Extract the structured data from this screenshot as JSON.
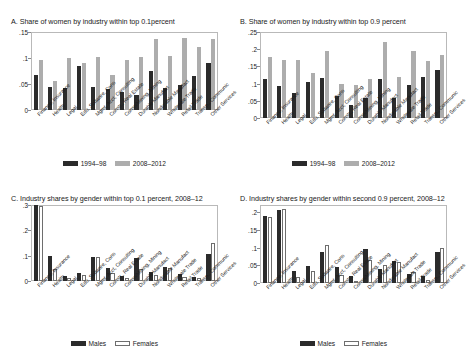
{
  "figure": {
    "background": "#ffffff",
    "colors": {
      "dark_bar": "#2b2b2b",
      "light_bar": "#adadad",
      "hollow_bar_fill": "#ffffff",
      "hollow_bar_edge": "#6e6e6e",
      "axis": "#8a8a8a",
      "text": "#1a1a1a"
    }
  },
  "industries": [
    "Finance, Insurance",
    "Health",
    "Legal",
    "Edu, Software, Cons",
    "Mgmt, Acct, Consulting",
    "Constr., Real Estate",
    "Conso/Mining, Mining",
    "Durable Manufact",
    "Nondurable Manufact",
    "Wholesale Trade",
    "Retail Trade",
    "Transp., Communic",
    "Other Services"
  ],
  "chart_data": [
    {
      "id": "panel-a",
      "type": "bar",
      "title": "A. Share of women by industry within top 0.1percent",
      "xlabel": "",
      "ylabel": "",
      "ylim": [
        0,
        0.15
      ],
      "yticks": [
        0,
        0.05,
        0.1,
        0.15
      ],
      "ytick_labels": [
        "0",
        ".05",
        ".1",
        ".15"
      ],
      "grid": false,
      "legend_position": "bottom",
      "categories": [
        "Finance, Insurance",
        "Health",
        "Legal",
        "Edu, Software, Cons",
        "Mgmt, Acct, Consulting",
        "Constr., Real Estate",
        "Conso/Mining, Mining",
        "Durable Manufact",
        "Nondurable Manufact",
        "Wholesale Trade",
        "Retail Trade",
        "Transp., Communic",
        "Other Services"
      ],
      "series": [
        {
          "name": "1994–98",
          "color": "#2b2b2b",
          "values": [
            0.067,
            0.044,
            0.042,
            0.084,
            0.045,
            0.04,
            0.034,
            0.029,
            0.075,
            0.042,
            0.049,
            0.065,
            0.09
          ]
        },
        {
          "name": "2008–2012",
          "color": "#adadad",
          "values": [
            0.097,
            0.055,
            0.1,
            0.09,
            0.101,
            0.068,
            0.096,
            0.101,
            0.137,
            0.103,
            0.138,
            0.122,
            0.137
          ]
        }
      ]
    },
    {
      "id": "panel-b",
      "type": "bar",
      "title": "B. Share of women by industry within top 0.9 percent",
      "xlabel": "",
      "ylabel": "",
      "ylim": [
        0,
        0.25
      ],
      "yticks": [
        0,
        0.05,
        0.1,
        0.15,
        0.2,
        0.25
      ],
      "ytick_labels": [
        "0",
        ".05",
        ".1",
        ".15",
        ".2",
        ".25"
      ],
      "grid": false,
      "legend_position": "bottom",
      "categories": [
        "Finance, Insurance",
        "Health",
        "Legal",
        "Edu, Software, Cons",
        "Mgmt, Acct, Consulting",
        "Constr., Real Estate",
        "Conso/Mining, Mining",
        "Durable Manufact",
        "Nondurable Manufact",
        "Wholesale Trade",
        "Retail Trade",
        "Transp., Communic",
        "Other Services"
      ],
      "series": [
        {
          "name": "1994–98",
          "color": "#2b2b2b",
          "values": [
            0.112,
            0.093,
            0.074,
            0.105,
            0.117,
            0.064,
            0.038,
            0.058,
            0.114,
            0.059,
            0.096,
            0.119,
            0.14
          ]
        },
        {
          "name": "2008–2012",
          "color": "#adadad",
          "values": [
            0.176,
            0.169,
            0.17,
            0.132,
            0.194,
            0.099,
            0.095,
            0.113,
            0.221,
            0.119,
            0.194,
            0.167,
            0.183
          ]
        }
      ]
    },
    {
      "id": "panel-c",
      "type": "bar",
      "title": "C. Industry shares by gender within top 0.1 percent, 2008–12",
      "xlabel": "",
      "ylabel": "",
      "ylim": [
        0,
        0.3
      ],
      "yticks": [
        0,
        0.1,
        0.2,
        0.3
      ],
      "ytick_labels": [
        "0",
        ".1",
        ".2",
        ".3"
      ],
      "grid": false,
      "legend_position": "bottom",
      "categories": [
        "Finance, Insurance",
        "Health",
        "Legal",
        "Edu, Software, Cons",
        "Mgmt, Acct, Consulting",
        "Constr., Real Estate",
        "Conso/Mining, Mining",
        "Durable Manufact",
        "Nondurable Manufact",
        "Wholesale Trade",
        "Retail Trade",
        "Transp., Communic",
        "Other Services"
      ],
      "series": [
        {
          "name": "Males",
          "color": "#2b2b2b",
          "values": [
            0.3,
            0.098,
            0.019,
            0.03,
            0.093,
            0.051,
            0.019,
            0.089,
            0.036,
            0.054,
            0.026,
            0.016,
            0.108
          ]
        },
        {
          "name": "Females",
          "color": "#ffffff",
          "values": [
            0.295,
            0.046,
            0.012,
            0.023,
            0.093,
            0.031,
            0.01,
            0.048,
            0.024,
            0.051,
            0.016,
            0.012,
            0.152
          ]
        }
      ]
    },
    {
      "id": "panel-d",
      "type": "bar",
      "title": "D. Industry shares by gender within second 0.9 percent, 2008–12",
      "xlabel": "",
      "ylabel": "",
      "ylim": [
        0,
        0.22
      ],
      "yticks": [
        0,
        0.05,
        0.1,
        0.15,
        0.2
      ],
      "ytick_labels": [
        "0",
        ".05",
        ".1",
        ".15",
        ".2"
      ],
      "grid": false,
      "legend_position": "bottom",
      "categories": [
        "Finance, Insurance",
        "Health",
        "Legal",
        "Edu, Software, Cons",
        "Mgmt, Acct, Consulting",
        "Constr., Real Estate",
        "Conso/Mining, Mining",
        "Durable Manufact",
        "Nondurable Manufact",
        "Wholesale Trade",
        "Retail Trade",
        "Transp., Communic",
        "Other Services"
      ],
      "series": [
        {
          "name": "Males",
          "color": "#2b2b2b",
          "values": [
            0.188,
            0.207,
            0.034,
            0.047,
            0.088,
            0.045,
            0.02,
            0.096,
            0.039,
            0.061,
            0.026,
            0.019,
            0.088
          ]
        },
        {
          "name": "Females",
          "color": "#ffffff",
          "values": [
            0.185,
            0.21,
            0.018,
            0.034,
            0.108,
            0.022,
            0.006,
            0.065,
            0.052,
            0.06,
            0.031,
            0.009,
            0.098
          ]
        }
      ]
    }
  ]
}
